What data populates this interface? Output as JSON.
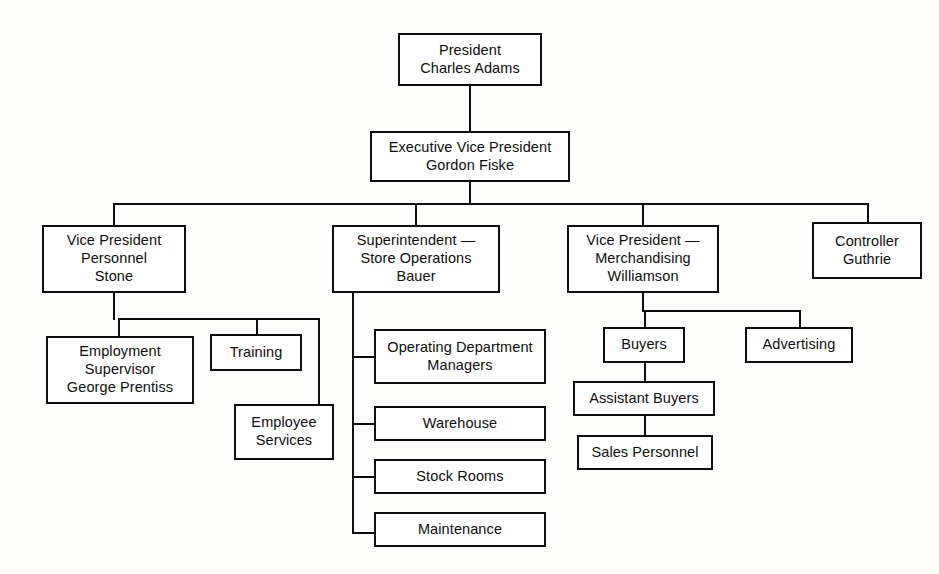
{
  "chart_title": "Retail Store Organization Chart",
  "boxes": [
    {
      "id": "president",
      "label": "President\nCharles Adams",
      "x": 398,
      "y": 33,
      "w": 144,
      "h": 53
    },
    {
      "id": "exec_vp",
      "label": "Executive Vice President\nGordon Fiske",
      "x": 370,
      "y": 131,
      "w": 200,
      "h": 51
    },
    {
      "id": "vp_personnel",
      "label": "Vice President\nPersonnel\nStone",
      "x": 42,
      "y": 225,
      "w": 144,
      "h": 68
    },
    {
      "id": "superintendent",
      "label": "Superintendent —\nStore Operations\nBauer",
      "x": 332,
      "y": 225,
      "w": 168,
      "h": 68
    },
    {
      "id": "vp_merchandising",
      "label": "Vice President —\nMerchandising\nWilliamson",
      "x": 567,
      "y": 225,
      "w": 152,
      "h": 68
    },
    {
      "id": "controller",
      "label": "Controller\nGuthrie",
      "x": 812,
      "y": 222,
      "w": 110,
      "h": 57
    },
    {
      "id": "employment_sup",
      "label": "Employment\nSupervisor\nGeorge Prentiss",
      "x": 46,
      "y": 336,
      "w": 148,
      "h": 68
    },
    {
      "id": "training",
      "label": "Training",
      "x": 210,
      "y": 334,
      "w": 92,
      "h": 37
    },
    {
      "id": "employee_services",
      "label": "Employee\nServices",
      "x": 234,
      "y": 404,
      "w": 100,
      "h": 56
    },
    {
      "id": "operating_dept",
      "label": "Operating Department\nManagers",
      "x": 374,
      "y": 329,
      "w": 172,
      "h": 55
    },
    {
      "id": "warehouse",
      "label": "Warehouse",
      "x": 374,
      "y": 406,
      "w": 172,
      "h": 35
    },
    {
      "id": "stock_rooms",
      "label": "Stock Rooms",
      "x": 374,
      "y": 459,
      "w": 172,
      "h": 35
    },
    {
      "id": "maintenance",
      "label": "Maintenance",
      "x": 374,
      "y": 512,
      "w": 172,
      "h": 35
    },
    {
      "id": "buyers",
      "label": "Buyers",
      "x": 603,
      "y": 327,
      "w": 82,
      "h": 36
    },
    {
      "id": "advertising",
      "label": "Advertising",
      "x": 745,
      "y": 327,
      "w": 108,
      "h": 36
    },
    {
      "id": "assistant_buyers",
      "label": "Assistant Buyers",
      "x": 573,
      "y": 381,
      "w": 142,
      "h": 35
    },
    {
      "id": "sales_personnel",
      "label": "Sales Personnel",
      "x": 577,
      "y": 435,
      "w": 136,
      "h": 35
    }
  ],
  "connectors": [
    {
      "id": "president-down",
      "type": "v",
      "x": 469,
      "y": 86,
      "len": 45
    },
    {
      "id": "execvp-down",
      "type": "v",
      "x": 469,
      "y": 182,
      "len": 21
    },
    {
      "id": "tier2-bus",
      "type": "h",
      "x": 113,
      "y": 203,
      "len": 754
    },
    {
      "id": "bus-drop-personnel",
      "type": "v",
      "x": 113,
      "y": 203,
      "len": 22
    },
    {
      "id": "bus-drop-superintendent",
      "type": "v",
      "x": 415,
      "y": 203,
      "len": 22
    },
    {
      "id": "bus-drop-merchandising",
      "type": "v",
      "x": 642,
      "y": 203,
      "len": 22
    },
    {
      "id": "bus-drop-controller",
      "type": "v",
      "x": 867,
      "y": 203,
      "len": 19
    },
    {
      "id": "personnel-down",
      "type": "v",
      "x": 113,
      "y": 293,
      "len": 27
    },
    {
      "id": "personnel-bus",
      "type": "h",
      "x": 118,
      "y": 318,
      "len": 202
    },
    {
      "id": "personnel-drop-employment",
      "type": "v",
      "x": 118,
      "y": 318,
      "len": 18
    },
    {
      "id": "personnel-drop-training",
      "type": "v",
      "x": 256,
      "y": 318,
      "len": 16
    },
    {
      "id": "personnel-drop-empservices",
      "type": "v",
      "x": 318,
      "y": 318,
      "len": 92
    },
    {
      "id": "empservices-stub",
      "type": "h",
      "x": 318,
      "y": 408,
      "len": 16
    },
    {
      "id": "super-spine",
      "type": "v",
      "x": 352,
      "y": 293,
      "len": 241
    },
    {
      "id": "super-stub-operating",
      "type": "h",
      "x": 352,
      "y": 356,
      "len": 24
    },
    {
      "id": "super-stub-warehouse",
      "type": "h",
      "x": 352,
      "y": 423,
      "len": 24
    },
    {
      "id": "super-stub-stock",
      "type": "h",
      "x": 352,
      "y": 476,
      "len": 24
    },
    {
      "id": "super-stub-maintenance",
      "type": "h",
      "x": 352,
      "y": 532,
      "len": 24
    },
    {
      "id": "merch-down",
      "type": "v",
      "x": 642,
      "y": 293,
      "len": 19
    },
    {
      "id": "merch-bus",
      "type": "h",
      "x": 644,
      "y": 310,
      "len": 155
    },
    {
      "id": "merch-drop-buyers",
      "type": "v",
      "x": 644,
      "y": 310,
      "len": 18
    },
    {
      "id": "merch-drop-advertising",
      "type": "v",
      "x": 799,
      "y": 310,
      "len": 18
    },
    {
      "id": "buyers-to-assistant",
      "type": "v",
      "x": 644,
      "y": 363,
      "len": 19
    },
    {
      "id": "assistant-to-sales",
      "type": "v",
      "x": 644,
      "y": 416,
      "len": 20
    }
  ],
  "colors": {
    "line": "#0d0d0d",
    "box_fill": "#ffffff",
    "background": "#fdfdfb",
    "text": "#0d0d0d"
  }
}
